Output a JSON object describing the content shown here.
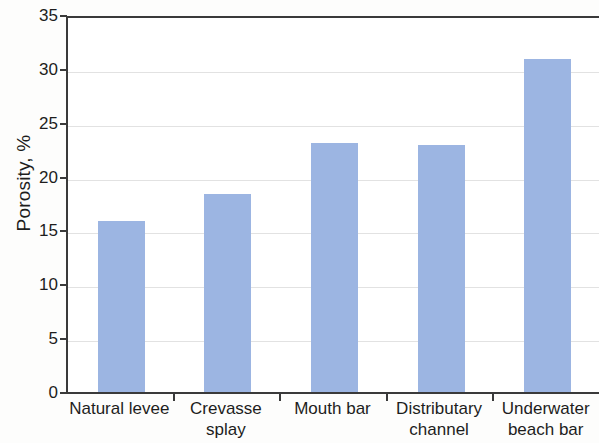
{
  "chart_data": {
    "type": "bar",
    "title": "",
    "xlabel": "",
    "ylabel": "Porosity, %",
    "categories": [
      "Natural levee",
      "Crevasse splay",
      "Mouth bar",
      "Distributary channel",
      "Underwater beach bar"
    ],
    "category_lines": [
      [
        "Natural levee"
      ],
      [
        "Crevasse",
        "splay"
      ],
      [
        "Mouth bar"
      ],
      [
        "Distributary",
        "channel"
      ],
      [
        "Underwater",
        "beach bar"
      ]
    ],
    "values": [
      16.0,
      18.5,
      23.2,
      23.0,
      31.0
    ],
    "ylim": [
      0,
      35
    ],
    "ytick_step": 5,
    "yticks": [
      35,
      30,
      25,
      20,
      15,
      10,
      5,
      0
    ],
    "ytick_labels": [
      "35",
      "30",
      "25",
      "20",
      "15",
      "10",
      "5",
      "0"
    ],
    "grid": "horizontal",
    "legend": "none",
    "bar_color": "#9cb5e2",
    "axis_color": "#3a3a3a",
    "gridline_color": "#e2e2e2",
    "text_color": "#1d1d1d"
  }
}
